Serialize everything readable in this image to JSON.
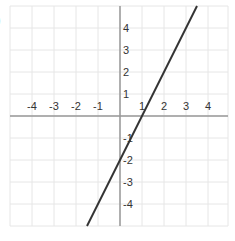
{
  "label": ")",
  "chart_data": {
    "type": "line",
    "title": "",
    "xlabel": "",
    "ylabel": "",
    "xlim": [
      -5,
      5
    ],
    "ylim": [
      -5,
      5
    ],
    "grid": true,
    "x_ticks": [
      -4,
      -3,
      -2,
      -1,
      1,
      2,
      3,
      4
    ],
    "y_ticks": [
      4,
      3,
      2,
      1,
      -1,
      -2,
      -3,
      -4
    ],
    "x_tick_labels": [
      "-4",
      "-3",
      "-2",
      "-1",
      "1",
      "2",
      "3",
      "4"
    ],
    "y_tick_labels": [
      "4",
      "3",
      "2",
      "1",
      "-1",
      "-2",
      "-3",
      "-4"
    ],
    "series": [
      {
        "name": "y = 2x - 2",
        "x": [
          -1.5,
          3.5
        ],
        "y": [
          -5,
          5
        ],
        "color": "#333333"
      }
    ]
  },
  "colors": {
    "grid": "#e6e6e6",
    "axis": "#999999",
    "line": "#333333"
  }
}
